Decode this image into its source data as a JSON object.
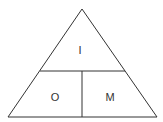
{
  "diagram": {
    "type": "formula-triangle",
    "colors": {
      "stroke": "#333333",
      "background": "#ffffff"
    },
    "labels": {
      "top": "I",
      "bottom_left": "O",
      "bottom_right": "M"
    }
  }
}
